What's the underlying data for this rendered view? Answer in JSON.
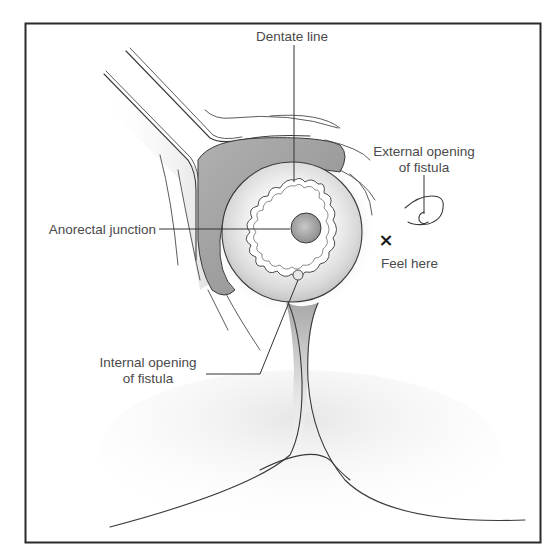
{
  "figure": {
    "type": "anatomical-diagram",
    "labels": {
      "dentate_line": "Dentate line",
      "anorectal_junction": "Anorectal junction",
      "external_opening_line1": "External opening",
      "external_opening_line2": "of fistula",
      "feel_here": "Feel here",
      "internal_opening_line1": "Internal opening",
      "internal_opening_line2": "of fistula"
    },
    "markers": {
      "feel_here_symbol": "×"
    },
    "colors": {
      "frame": "#2a2a2a",
      "outline": "#3a3a3a",
      "shaded_tissue": "#9a9a9a",
      "text": "#4a4a4a"
    }
  }
}
